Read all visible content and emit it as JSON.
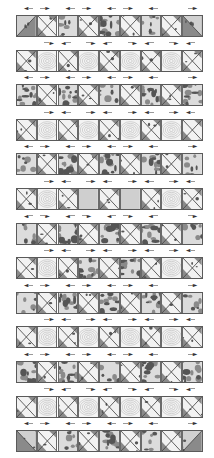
{
  "diagram": {
    "rows_count": 13,
    "blocks_per_row": 9,
    "colors": {
      "border": "#6a6a6a",
      "print_dark": "#555555",
      "print_mid": "#8a8a8a",
      "print_light": "#dcdcdc",
      "swirl_line": "#b5b5b5",
      "solid_fill": "#cfcfcf",
      "arrow": "#333333"
    },
    "arrow_patterns": {
      "odd": [
        "left",
        "right",
        "left",
        "right",
        "left",
        "right",
        "left",
        "right"
      ],
      "even": [
        "right",
        "left",
        "right",
        "left",
        "right",
        "left",
        "right",
        "left"
      ]
    },
    "rows": [
      {
        "index": 1,
        "type": "odd",
        "arrows": "odd",
        "blocks": [
          "corner-left",
          "hourglass",
          "print",
          "hourglass",
          "print-dark",
          "hourglass",
          "print",
          "hourglass",
          "corner-right"
        ]
      },
      {
        "index": 2,
        "type": "even",
        "arrows": "even",
        "blocks": [
          "hourglass",
          "swirl",
          "hourglass",
          "swirl",
          "hourglass",
          "swirl",
          "hourglass",
          "swirl",
          "hourglass"
        ]
      },
      {
        "index": 3,
        "type": "odd",
        "arrows": "odd",
        "blocks": [
          "print-dark",
          "hourglass",
          "print-dark",
          "hourglass",
          "print",
          "hourglass",
          "print-dark",
          "hourglass",
          "print-dark"
        ]
      },
      {
        "index": 4,
        "type": "even",
        "arrows": "even",
        "blocks": [
          "hourglass",
          "swirl",
          "hourglass",
          "swirl",
          "hourglass",
          "swirl",
          "hourglass",
          "swirl",
          "hourglass"
        ]
      },
      {
        "index": 5,
        "type": "odd",
        "arrows": "odd",
        "blocks": [
          "print",
          "hourglass",
          "print-dark",
          "hourglass",
          "print-dark",
          "hourglass",
          "print-dark",
          "hourglass",
          "print"
        ]
      },
      {
        "index": 6,
        "type": "even",
        "arrows": "even",
        "blocks": [
          "hourglass",
          "swirl",
          "hourglass",
          "solid",
          "hourglass",
          "solid",
          "hourglass",
          "swirl",
          "hourglass"
        ]
      },
      {
        "index": 7,
        "type": "odd",
        "arrows": "odd",
        "blocks": [
          "print",
          "hourglass",
          "print-dark",
          "hourglass",
          "print-dark",
          "hourglass",
          "print-dark",
          "hourglass",
          "print"
        ]
      },
      {
        "index": 8,
        "type": "even",
        "arrows": "even",
        "blocks": [
          "hourglass",
          "swirl",
          "hourglass",
          "print-dark",
          "hourglass",
          "print-dark",
          "hourglass",
          "swirl",
          "hourglass"
        ]
      },
      {
        "index": 9,
        "type": "odd",
        "arrows": "odd",
        "blocks": [
          "print",
          "hourglass",
          "print-dark",
          "hourglass",
          "print-dark",
          "hourglass",
          "print-dark",
          "hourglass",
          "print"
        ]
      },
      {
        "index": 10,
        "type": "even",
        "arrows": "even",
        "blocks": [
          "hourglass",
          "swirl",
          "hourglass",
          "swirl",
          "hourglass",
          "swirl",
          "hourglass",
          "swirl",
          "hourglass"
        ]
      },
      {
        "index": 11,
        "type": "odd",
        "arrows": "odd",
        "blocks": [
          "print-dark",
          "hourglass",
          "print-dark",
          "hourglass",
          "print",
          "hourglass",
          "print-dark",
          "hourglass",
          "print-dark"
        ]
      },
      {
        "index": 12,
        "type": "even",
        "arrows": "even",
        "blocks": [
          "hourglass",
          "swirl",
          "hourglass",
          "swirl",
          "hourglass",
          "swirl",
          "hourglass",
          "swirl",
          "hourglass"
        ]
      },
      {
        "index": 13,
        "type": "odd",
        "arrows": "odd",
        "blocks": [
          "corner-left-bottom",
          "hourglass",
          "print",
          "hourglass",
          "print-dark",
          "hourglass",
          "print",
          "hourglass",
          "corner-right-bottom"
        ]
      }
    ],
    "icons": {
      "left": "arrow-left-icon",
      "right": "arrow-right-icon"
    }
  }
}
